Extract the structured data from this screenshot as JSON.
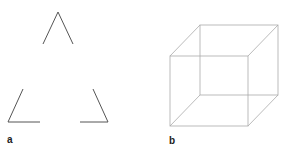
{
  "panels": [
    {
      "label": "a",
      "description": "Illusory (Kanizsa-style) triangle formed by three corner fragments"
    },
    {
      "label": "b",
      "description": "Wireframe Necker cube"
    }
  ],
  "colors": {
    "triangle_stroke": "#555555",
    "cube_stroke": "#aaaaaa",
    "label": "#222222"
  }
}
